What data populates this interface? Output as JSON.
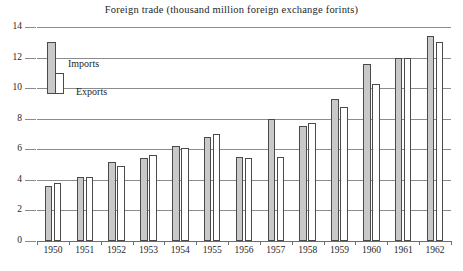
{
  "chart_data": {
    "type": "bar",
    "title": "Foreign trade (thousand million foreign exchange forints)",
    "xlabel": "",
    "ylabel": "",
    "ylim": [
      0,
      14
    ],
    "yticks": [
      0,
      2,
      4,
      6,
      8,
      10,
      12,
      14
    ],
    "ytick_labels": [
      "0",
      "2",
      "4",
      "6",
      "8",
      "10",
      "12",
      "14"
    ],
    "grid": true,
    "legend_position": "upper-left",
    "categories": [
      "1950",
      "1951",
      "1952",
      "1953",
      "1954",
      "1955",
      "1956",
      "1957",
      "1958",
      "1959",
      "1960",
      "1961",
      "1962"
    ],
    "series": [
      {
        "name": "Imports",
        "color": "#c9c9c9",
        "values": [
          3.6,
          4.2,
          5.2,
          5.4,
          6.2,
          6.8,
          5.5,
          8.0,
          7.5,
          9.3,
          11.6,
          12.0,
          13.4
        ]
      },
      {
        "name": "Exports",
        "color": "#ffffff",
        "values": [
          3.8,
          4.2,
          4.9,
          5.6,
          6.1,
          7.0,
          5.4,
          5.5,
          7.7,
          8.8,
          10.3,
          12.0,
          13.0
        ]
      }
    ]
  },
  "legend": {
    "imports_label": "Imports",
    "exports_label": "Exports"
  }
}
